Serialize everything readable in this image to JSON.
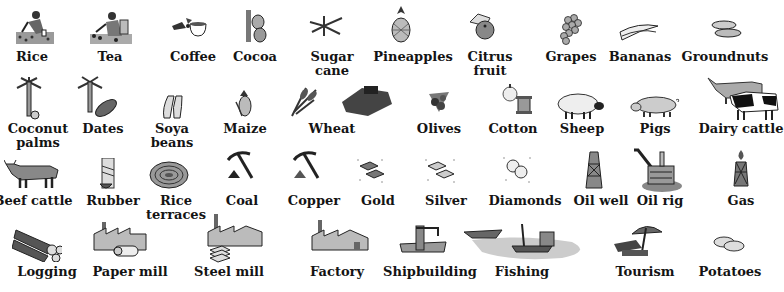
{
  "legend": {
    "rows": [
      {
        "items": [
          {
            "id": "rice",
            "label": "Rice",
            "icon": "rice-farmer-icon"
          },
          {
            "id": "tea",
            "label": "Tea",
            "icon": "tea-picker-icon"
          },
          {
            "id": "coffee",
            "label": "Coffee",
            "icon": "coffee-cup-icon"
          },
          {
            "id": "cocoa",
            "label": "Cocoa",
            "icon": "cocoa-pods-icon"
          },
          {
            "id": "sugar_cane",
            "label": "Sugar\ncane",
            "label_lines": [
              "Sugar",
              "cane"
            ],
            "icon": "sugar-cane-icon"
          },
          {
            "id": "pineapples",
            "label": "Pineapples",
            "icon": "pineapple-icon"
          },
          {
            "id": "citrus_fruit",
            "label": "Citrus\nfruit",
            "label_lines": [
              "Citrus",
              "fruit"
            ],
            "icon": "citrus-fruit-icon"
          },
          {
            "id": "grapes",
            "label": "Grapes",
            "icon": "grapes-icon"
          },
          {
            "id": "bananas",
            "label": "Bananas",
            "icon": "bananas-icon"
          },
          {
            "id": "groundnuts",
            "label": "Groundnuts",
            "icon": "groundnuts-icon"
          }
        ]
      },
      {
        "items": [
          {
            "id": "coconut_palms",
            "label_lines": [
              "Coconut",
              "palms"
            ],
            "icon": "coconut-palm-icon"
          },
          {
            "id": "dates",
            "label": "Dates",
            "icon": "date-palm-icon"
          },
          {
            "id": "soya_beans",
            "label_lines": [
              "Soya",
              "beans"
            ],
            "icon": "soya-beans-icon"
          },
          {
            "id": "maize",
            "label": "Maize",
            "icon": "maize-cob-icon"
          },
          {
            "id": "wheat",
            "label": "Wheat",
            "icon": "wheat-harvester-icon"
          },
          {
            "id": "olives",
            "label": "Olives",
            "icon": "olives-icon"
          },
          {
            "id": "cotton",
            "label": "Cotton",
            "icon": "cotton-spool-icon"
          },
          {
            "id": "sheep",
            "label": "Sheep",
            "icon": "sheep-icon"
          },
          {
            "id": "pigs",
            "label": "Pigs",
            "icon": "pig-icon"
          },
          {
            "id": "dairy_cattle",
            "label": "Dairy cattle",
            "icon": "dairy-cattle-icon"
          }
        ]
      },
      {
        "items": [
          {
            "id": "beef_cattle",
            "label": "Beef cattle",
            "icon": "beef-cattle-icon"
          },
          {
            "id": "rubber",
            "label": "Rubber",
            "icon": "rubber-tree-icon"
          },
          {
            "id": "rice_terraces",
            "label_lines": [
              "Rice",
              "terraces"
            ],
            "icon": "rice-terraces-icon"
          },
          {
            "id": "coal",
            "label": "Coal",
            "icon": "pickaxe-coal-icon"
          },
          {
            "id": "copper",
            "label": "Copper",
            "icon": "pickaxe-copper-icon"
          },
          {
            "id": "gold",
            "label": "Gold",
            "icon": "gold-bars-icon"
          },
          {
            "id": "silver",
            "label": "Silver",
            "icon": "silver-bars-icon"
          },
          {
            "id": "diamonds",
            "label": "Diamonds",
            "icon": "diamonds-icon"
          },
          {
            "id": "oil_well",
            "label": "Oil well",
            "icon": "oil-derrick-icon"
          },
          {
            "id": "oil_rig",
            "label": "Oil rig",
            "icon": "offshore-oil-rig-icon"
          },
          {
            "id": "gas",
            "label": "Gas",
            "icon": "gas-flare-icon"
          }
        ]
      },
      {
        "items": [
          {
            "id": "logging",
            "label": "Logging",
            "icon": "log-pile-icon"
          },
          {
            "id": "paper_mill",
            "label": "Paper mill",
            "icon": "paper-mill-icon"
          },
          {
            "id": "steel_mill",
            "label": "Steel mill",
            "icon": "steel-mill-icon"
          },
          {
            "id": "factory",
            "label": "Factory",
            "icon": "factory-icon"
          },
          {
            "id": "shipbuilding",
            "label": "Shipbuilding",
            "icon": "shipbuilding-crane-icon"
          },
          {
            "id": "fishing",
            "label": "Fishing",
            "icon": "fishing-boats-icon"
          },
          {
            "id": "tourism",
            "label": "Tourism",
            "icon": "beach-umbrella-icon"
          },
          {
            "id": "potatoes",
            "label": "Potatoes",
            "icon": "potatoes-icon"
          }
        ]
      }
    ]
  },
  "labels": {
    "rice": "Rice",
    "tea": "Tea",
    "coffee": "Coffee",
    "cocoa": "Cocoa",
    "sugar_1": "Sugar",
    "sugar_2": "cane",
    "pineapples": "Pineapples",
    "citrus_1": "Citrus",
    "citrus_2": "fruit",
    "grapes": "Grapes",
    "bananas": "Bananas",
    "groundnuts": "Groundnuts",
    "coconut_1": "Coconut",
    "coconut_2": "palms",
    "dates": "Dates",
    "soya_1": "Soya",
    "soya_2": "beans",
    "maize": "Maize",
    "wheat": "Wheat",
    "olives": "Olives",
    "cotton": "Cotton",
    "sheep": "Sheep",
    "pigs": "Pigs",
    "dairy_cattle": "Dairy cattle",
    "beef_cattle": "Beef cattle",
    "rubber": "Rubber",
    "rice_terr_1": "Rice",
    "rice_terr_2": "terraces",
    "coal": "Coal",
    "copper": "Copper",
    "gold": "Gold",
    "silver": "Silver",
    "diamonds": "Diamonds",
    "oil_well": "Oil well",
    "oil_rig": "Oil rig",
    "gas": "Gas",
    "logging": "Logging",
    "paper_mill": "Paper mill",
    "steel_mill": "Steel mill",
    "factory": "Factory",
    "shipbuilding": "Shipbuilding",
    "fishing": "Fishing",
    "tourism": "Tourism",
    "potatoes": "Potatoes"
  },
  "colors": {
    "ink": "#141414",
    "grey_fill": "#9a9a9a",
    "light_fill": "#d8d8d8",
    "background": "#ffffff"
  }
}
